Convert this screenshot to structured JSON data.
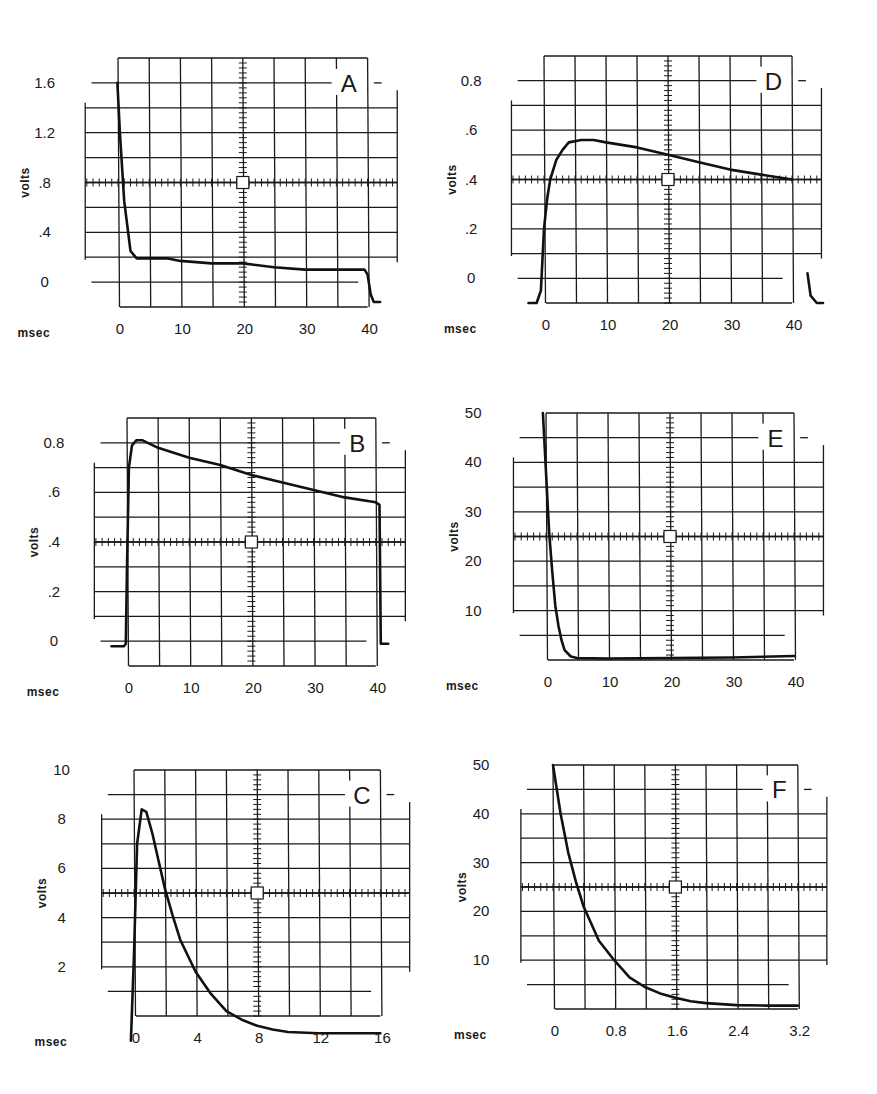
{
  "figure": {
    "layout": "3 rows x 2 columns of oscilloscope traces",
    "caption_fragment": "",
    "panels_order": [
      "A",
      "D",
      "B",
      "E",
      "C",
      "F"
    ]
  },
  "chart_data": [
    {
      "panel": "A",
      "type": "line",
      "title": "A",
      "xlabel": "msec",
      "ylabel": "volts",
      "x_ticks": [
        "0",
        "10",
        "20",
        "30",
        "40"
      ],
      "y_ticks": [
        "0",
        ".4",
        ".8",
        "1.2",
        "1.6"
      ],
      "xlim": [
        0,
        40
      ],
      "ylim": [
        -0.2,
        1.8
      ],
      "grid": true,
      "x": [
        -0.1,
        0.3,
        1.0,
        2.0,
        3.0,
        5.0,
        8.0,
        10.0,
        15.0,
        20.0,
        25.0,
        30.0,
        35.0,
        39.5,
        40.0,
        40.5,
        41.0,
        42.0
      ],
      "values": [
        1.8,
        1.4,
        0.85,
        0.45,
        0.39,
        0.39,
        0.39,
        0.37,
        0.35,
        0.35,
        0.32,
        0.3,
        0.3,
        0.3,
        0.26,
        0.1,
        0.04,
        0.04
      ]
    },
    {
      "panel": "D",
      "type": "line",
      "title": "D",
      "xlabel": "msec",
      "ylabel": "volts",
      "x_ticks": [
        "0",
        "10",
        "20",
        "30",
        "40"
      ],
      "y_ticks": [
        "0",
        ".2",
        ".4",
        ".6",
        "0.8"
      ],
      "xlim": [
        0,
        40
      ],
      "ylim": [
        -0.1,
        0.9
      ],
      "grid": true,
      "x": [
        -2.5,
        -1.2,
        -0.5,
        0.0,
        0.5,
        1.0,
        2.0,
        3.0,
        4.0,
        6.0,
        8.0,
        10.0,
        15.0,
        20.0,
        25.0,
        30.0,
        35.0,
        40.0
      ],
      "values": [
        0.0,
        0.0,
        0.05,
        0.3,
        0.42,
        0.5,
        0.58,
        0.62,
        0.65,
        0.66,
        0.66,
        0.65,
        0.63,
        0.6,
        0.57,
        0.54,
        0.52,
        0.5
      ],
      "tail": {
        "x": [
          42.5,
          43.0,
          44.0,
          45.0
        ],
        "values": [
          0.12,
          0.03,
          0.0,
          0.0
        ]
      }
    },
    {
      "panel": "B",
      "type": "line",
      "title": "B",
      "xlabel": "msec",
      "ylabel": "volts",
      "x_ticks": [
        "0",
        "10",
        "20",
        "30",
        "40"
      ],
      "y_ticks": [
        "0",
        ".2",
        ".4",
        ".6",
        "0.8"
      ],
      "xlim": [
        0,
        40
      ],
      "ylim": [
        -0.1,
        0.9
      ],
      "grid": true,
      "x": [
        -2.5,
        -0.5,
        -0.2,
        0.0,
        0.3,
        0.8,
        1.5,
        2.5,
        5.0,
        10.0,
        15.0,
        20.0,
        25.0,
        30.0,
        35.0,
        40.0,
        40.6,
        40.8,
        42.0
      ],
      "values": [
        -0.02,
        -0.02,
        -0.01,
        0.3,
        0.7,
        0.79,
        0.81,
        0.81,
        0.78,
        0.74,
        0.71,
        0.67,
        0.64,
        0.61,
        0.58,
        0.56,
        0.55,
        -0.01,
        -0.01
      ]
    },
    {
      "panel": "E",
      "type": "line",
      "title": "E",
      "xlabel": "msec",
      "ylabel": "volts",
      "x_ticks": [
        "0",
        "10",
        "20",
        "30",
        "40"
      ],
      "y_ticks": [
        "10",
        "20",
        "30",
        "40",
        "50"
      ],
      "xlim": [
        0,
        40
      ],
      "ylim": [
        0,
        50
      ],
      "grid": true,
      "x": [
        -0.5,
        0.0,
        0.5,
        1.0,
        1.5,
        2.0,
        2.5,
        3.0,
        4.0,
        5.0,
        10.0,
        20.0,
        30.0,
        40.0
      ],
      "values": [
        50,
        38,
        26,
        18,
        11,
        7,
        4,
        2,
        0.7,
        0.4,
        0.3,
        0.4,
        0.5,
        0.8
      ]
    },
    {
      "panel": "C",
      "type": "line",
      "title": "C",
      "xlabel": "msec",
      "ylabel": "volts",
      "x_ticks": [
        "0",
        "4",
        "8",
        "12",
        "16"
      ],
      "y_ticks": [
        "2",
        "4",
        "6",
        "8",
        "10"
      ],
      "xlim": [
        0,
        16
      ],
      "ylim": [
        0,
        10
      ],
      "grid": true,
      "x": [
        -0.2,
        0.0,
        0.2,
        0.5,
        0.8,
        1.2,
        1.6,
        2.0,
        2.5,
        3.0,
        4.0,
        5.0,
        6.0,
        7.0,
        8.0,
        9.0,
        10.0,
        12.0,
        14.0,
        16.0
      ],
      "values": [
        0.0,
        3.5,
        8.0,
        9.4,
        9.3,
        8.4,
        7.3,
        6.2,
        5.1,
        4.1,
        2.8,
        1.9,
        1.2,
        0.85,
        0.6,
        0.45,
        0.35,
        0.3,
        0.3,
        0.3
      ]
    },
    {
      "panel": "F",
      "type": "line",
      "title": "F",
      "xlabel": "msec",
      "ylabel": "volts",
      "x_ticks": [
        "0",
        "0.8",
        "1.6",
        "2.4",
        "3.2"
      ],
      "y_ticks": [
        "10",
        "20",
        "30",
        "40",
        "50"
      ],
      "xlim": [
        0,
        3.2
      ],
      "ylim": [
        0,
        50
      ],
      "grid": true,
      "x": [
        0.0,
        0.1,
        0.2,
        0.3,
        0.4,
        0.6,
        0.8,
        1.0,
        1.2,
        1.4,
        1.6,
        1.8,
        2.0,
        2.4,
        2.8,
        3.2
      ],
      "values": [
        50,
        40,
        32,
        26,
        21,
        14,
        10,
        6.5,
        4.5,
        3.2,
        2.3,
        1.6,
        1.2,
        0.8,
        0.7,
        0.7
      ]
    }
  ]
}
